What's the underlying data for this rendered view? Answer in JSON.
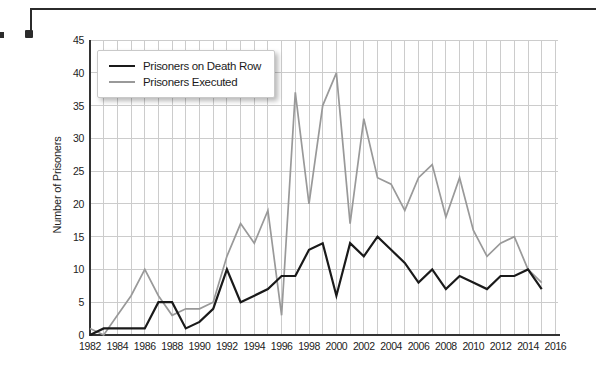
{
  "figure": {
    "background_color": "#ffffff",
    "decoration": "corner-bracket",
    "bracket_color": "#2b2b2b"
  },
  "chart_data": {
    "type": "line",
    "title": "",
    "xlabel": "",
    "ylabel": "Number of Prisoners",
    "xlim": [
      1982,
      2016
    ],
    "ylim": [
      0,
      45
    ],
    "grid": true,
    "grid_color": "#cccccc",
    "axis_color": "#333333",
    "legend_position": "upper-left",
    "x_tick_labels": [
      "1982",
      "1984",
      "1986",
      "1988",
      "1990",
      "1992",
      "1994",
      "1996",
      "1998",
      "2000",
      "2002",
      "2004",
      "2006",
      "2008",
      "2010",
      "2012",
      "2014",
      "2016"
    ],
    "y_ticks": [
      0,
      5,
      10,
      15,
      20,
      25,
      30,
      35,
      40,
      45
    ],
    "x": [
      1982,
      1983,
      1984,
      1985,
      1986,
      1987,
      1988,
      1989,
      1990,
      1991,
      1992,
      1993,
      1994,
      1995,
      1996,
      1997,
      1998,
      1999,
      2000,
      2001,
      2002,
      2003,
      2004,
      2005,
      2006,
      2007,
      2008,
      2009,
      2010,
      2011,
      2012,
      2013,
      2014,
      2015
    ],
    "series": [
      {
        "name": "Prisoners on Death Row",
        "color": "#1a1a1a",
        "stroke_width": 2.2,
        "values": [
          0,
          1,
          1,
          1,
          1,
          5,
          5,
          1,
          2,
          4,
          10,
          5,
          6,
          7,
          9,
          9,
          13,
          14,
          6,
          14,
          12,
          15,
          13,
          11,
          8,
          10,
          7,
          9,
          8,
          7,
          9,
          9,
          10,
          7
        ]
      },
      {
        "name": "Prisoners Executed",
        "color": "#999999",
        "stroke_width": 1.7,
        "values": [
          1,
          0,
          3,
          6,
          10,
          6,
          3,
          4,
          4,
          5,
          12,
          17,
          14,
          19,
          3,
          37,
          20,
          35,
          40,
          17,
          33,
          24,
          23,
          19,
          24,
          26,
          18,
          24,
          16,
          12,
          14,
          15,
          10,
          8
        ]
      }
    ]
  }
}
